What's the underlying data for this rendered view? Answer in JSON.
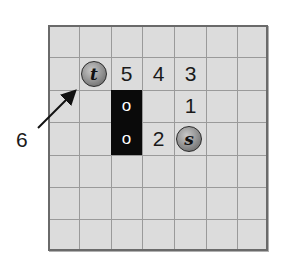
{
  "diagram": {
    "grid": {
      "columns": 7,
      "rows": 7,
      "background_color": "#dcdcdc",
      "line_color": "#9a9a9a",
      "border_color": "#6a6a6a"
    },
    "obstacles": [
      {
        "col": 2,
        "row": 2,
        "label": "o"
      },
      {
        "col": 2,
        "row": 3,
        "label": "o"
      }
    ],
    "start_node": {
      "label": "s",
      "col": 4,
      "row": 3
    },
    "target_node": {
      "label": "t",
      "col": 1,
      "row": 1
    },
    "distance_labels": [
      {
        "value": "5",
        "col": 2,
        "row": 1
      },
      {
        "value": "4",
        "col": 3,
        "row": 1
      },
      {
        "value": "3",
        "col": 4,
        "row": 1
      },
      {
        "value": "1",
        "col": 4,
        "row": 2
      },
      {
        "value": "2",
        "col": 3,
        "row": 3
      }
    ],
    "arrow_label": {
      "value": "6"
    },
    "obstacle_color": "#0a0a0a",
    "node_color": "#8e8e8e"
  }
}
